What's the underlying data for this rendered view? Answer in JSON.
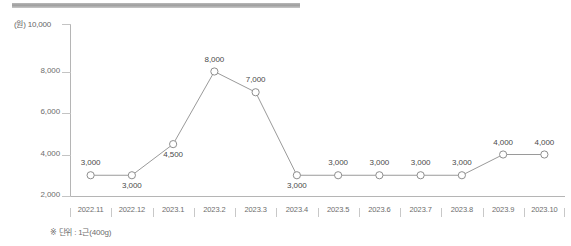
{
  "decor": {
    "top_bar_color": "#a8a8a8"
  },
  "axis_unit_label": "(원) 10,000",
  "footnote": "※ 단위 : 1근(400g)",
  "chart_data": {
    "type": "line",
    "title": "",
    "subtitle": "",
    "xlabel": "",
    "ylabel": "(원)",
    "unit_note": "※ 단위 : 1근(400g)",
    "categories": [
      "2022.11",
      "2022.12",
      "2023.1",
      "2023.2",
      "2023.3",
      "2023.4",
      "2023.5",
      "2023.6",
      "2023.7",
      "2023.8",
      "2023.9",
      "2023.10"
    ],
    "values": [
      3000,
      3000,
      4500,
      8000,
      7000,
      3000,
      3000,
      3000,
      3000,
      3000,
      4000,
      4000
    ],
    "point_labels": [
      "3,000",
      "3,000",
      "4,500",
      "8,000",
      "7,000",
      "3,000",
      "3,000",
      "3,000",
      "3,000",
      "3,000",
      "4,000",
      "4,000"
    ],
    "label_positions": [
      "above",
      "below",
      "below",
      "above",
      "above",
      "below",
      "above",
      "above",
      "above",
      "above",
      "above",
      "above"
    ],
    "ylim": [
      2000,
      10000
    ],
    "yticks": [
      2000,
      4000,
      6000,
      8000,
      10000
    ],
    "ytick_labels": [
      "2,000",
      "4,000",
      "6,000",
      "8,000",
      "10,000"
    ],
    "grid": false,
    "legend": "none",
    "line_color": "#9a9a9a",
    "marker": "open-circle",
    "marker_fill": "#ffffff",
    "marker_edge": "#8e8e8e"
  }
}
